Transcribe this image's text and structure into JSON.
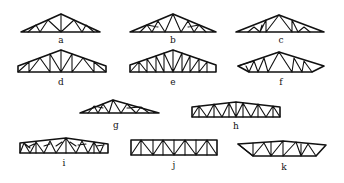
{
  "figure": {
    "trusses": [
      {
        "id": "a",
        "label": "a",
        "type": "triangular Fink/W-web truss"
      },
      {
        "id": "b",
        "label": "b",
        "type": "triangular compound Fink truss"
      },
      {
        "id": "c",
        "label": "c",
        "type": "triangular fan truss"
      },
      {
        "id": "d",
        "label": "d",
        "type": "trapezoidal-end triangular truss with vertical/diagonal web"
      },
      {
        "id": "e",
        "label": "e",
        "type": "Howe-type truss with end verticals"
      },
      {
        "id": "f",
        "label": "f",
        "type": "triangular truss with raised ends"
      },
      {
        "id": "g",
        "label": "g",
        "type": "low-pitch compound Fink truss"
      },
      {
        "id": "h",
        "label": "h",
        "type": "low-slope parallel/trapezoid Warren truss"
      },
      {
        "id": "i",
        "label": "i",
        "type": "low-slope truss with subdivided panels"
      },
      {
        "id": "j",
        "label": "j",
        "type": "parallel chord Warren truss with verticals"
      },
      {
        "id": "k",
        "label": "k",
        "type": "trapezoidal low-slope Warren truss"
      }
    ]
  }
}
